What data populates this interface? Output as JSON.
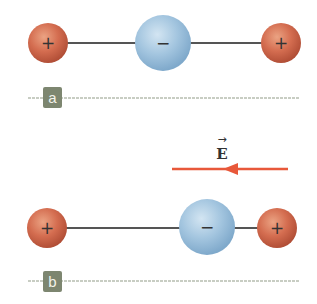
{
  "panels": [
    {
      "label": "a",
      "rod_y": 43,
      "charges": [
        {
          "sign": "+",
          "type": "positive",
          "cx": 48,
          "cy": 43,
          "r": 20
        },
        {
          "sign": "−",
          "type": "negative",
          "cx": 163,
          "cy": 43,
          "r": 28
        },
        {
          "sign": "+",
          "type": "positive",
          "cx": 281,
          "cy": 43,
          "r": 20
        }
      ],
      "label_box": {
        "x": 43,
        "y": 87,
        "w": 19,
        "h": 21
      },
      "divider_y": 98
    },
    {
      "label": "b",
      "rod_y": 228,
      "charges": [
        {
          "sign": "+",
          "type": "positive",
          "cx": 47,
          "cy": 228,
          "r": 20
        },
        {
          "sign": "−",
          "type": "negative",
          "cx": 207,
          "cy": 227,
          "r": 28
        },
        {
          "sign": "+",
          "type": "positive",
          "cx": 277,
          "cy": 228,
          "r": 20
        }
      ],
      "label_box": {
        "x": 43,
        "y": 271,
        "w": 19,
        "h": 21
      },
      "divider_y": 281
    }
  ],
  "field": {
    "symbol": "E",
    "vector_arrow": "→",
    "direction": "left",
    "color": "#e8583a"
  },
  "colors": {
    "positive_charge": "#cf6a4f",
    "negative_charge": "#9dc0dc",
    "rod": "#555555",
    "label_box": "#7d8670",
    "divider": "#b7bdb0"
  }
}
